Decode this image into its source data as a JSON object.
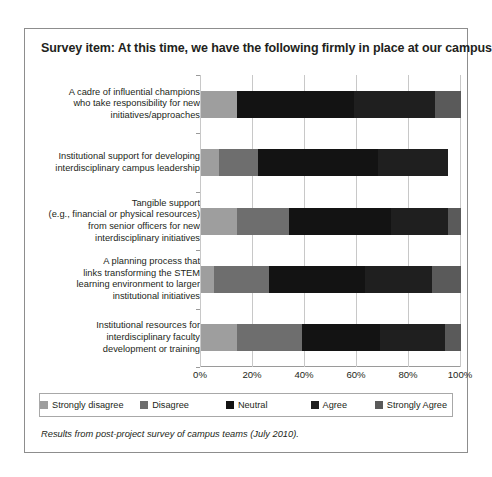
{
  "chart_data": {
    "type": "bar",
    "subtype": "stacked-horizontal-100pct",
    "title": "Survey item: At this time, we have the following firmly in place at our campus",
    "xlabel": "",
    "ylabel": "",
    "xlim": [
      0,
      100
    ],
    "xticks": [
      "0%",
      "20%",
      "40%",
      "60%",
      "80%",
      "100%"
    ],
    "xtick_values": [
      0,
      20,
      40,
      60,
      80,
      100
    ],
    "grid": true,
    "legend_position": "bottom",
    "orientation": "horizontal",
    "footnote": "Results from post-project survey of campus teams (July 2010).",
    "categories": [
      "A cadre of influential champions who take responsibility for new initiatives/approaches",
      "Institutional support for developing interdisciplinary campus leadership",
      "Tangible support (e.g., financial or physical resources) from senior officers for new interdisciplinary initiatives",
      "A planning process that links transforming the STEM learning environment to larger institutional initiatives",
      "Institutional resources for interdisciplinary faculty development or training"
    ],
    "category_lines": [
      [
        "A cadre of influential champions",
        "who take responsibility for new",
        "initiatives/approaches"
      ],
      [
        "Institutional support for developing",
        "interdisciplinary campus leadership"
      ],
      [
        "Tangible support",
        "(e.g., financial or physical resources)",
        "from senior officers for new",
        "interdisciplinary initiatives"
      ],
      [
        "A planning process that",
        "links transforming the STEM",
        "learning environment to larger",
        "institutional initiatives"
      ],
      [
        "Institutional resources for",
        "interdisciplinary faculty",
        "development or training"
      ]
    ],
    "series": [
      {
        "name": "Strongly disagree",
        "color": "#9e9e9e",
        "values": [
          14,
          7,
          14,
          5,
          14
        ]
      },
      {
        "name": "Disagree",
        "color": "#6e6e6e",
        "values": [
          0,
          15,
          20,
          21,
          25
        ]
      },
      {
        "name": "Neutral",
        "color": "#131313",
        "values": [
          45,
          46,
          39,
          37,
          30
        ]
      },
      {
        "name": "Agree",
        "color": "#1f1f1f",
        "values": [
          31,
          27,
          22,
          26,
          25
        ]
      },
      {
        "name": "Strongly Agree",
        "color": "#5a5a5a",
        "values": [
          10,
          0,
          5,
          11,
          6
        ]
      }
    ]
  },
  "legend": {
    "items": [
      {
        "label": "Strongly disagree",
        "color": "#9e9e9e"
      },
      {
        "label": "Disagree",
        "color": "#6e6e6e"
      },
      {
        "label": "Neutral",
        "color": "#131313"
      },
      {
        "label": "Agree",
        "color": "#1f1f1f"
      },
      {
        "label": "Strongly Agree",
        "color": "#5a5a5a"
      }
    ]
  }
}
